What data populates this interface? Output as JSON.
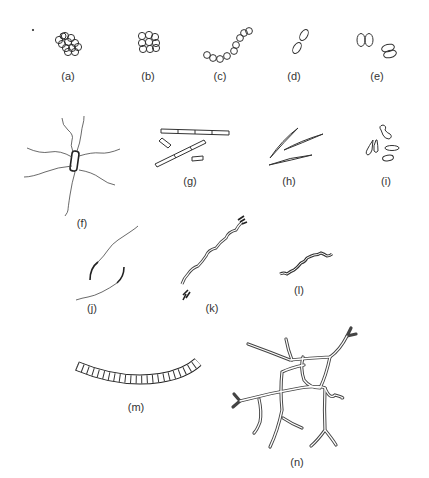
{
  "figure": {
    "panels": [
      {
        "id": "a",
        "label": "(a)",
        "description": "irregular cluster of cocci"
      },
      {
        "id": "b",
        "label": "(b)",
        "description": "cubical packet of cocci (sarcina)"
      },
      {
        "id": "c",
        "label": "(c)",
        "description": "chain of cocci"
      },
      {
        "id": "d",
        "label": "(d)",
        "description": "pair of oval cells"
      },
      {
        "id": "e",
        "label": "(e)",
        "description": "diplococci pairs"
      },
      {
        "id": "f",
        "label": "(f)",
        "description": "rod with peritrichous flagella"
      },
      {
        "id": "g",
        "label": "(g)",
        "description": "rod-shaped cells, some in chains"
      },
      {
        "id": "h",
        "label": "(h)",
        "description": "fusiform / needle-shaped cells"
      },
      {
        "id": "i",
        "label": "(i)",
        "description": "club-shaped / irregular rods"
      },
      {
        "id": "j",
        "label": "(j)",
        "description": "curved rods with polar flagella"
      },
      {
        "id": "k",
        "label": "(k)",
        "description": "spirillum with tufts of flagella"
      },
      {
        "id": "l",
        "label": "(l)",
        "description": "spirochete"
      },
      {
        "id": "m",
        "label": "(m)",
        "description": "segmented filament"
      },
      {
        "id": "n",
        "label": "(n)",
        "description": "branched mycelium"
      }
    ]
  }
}
